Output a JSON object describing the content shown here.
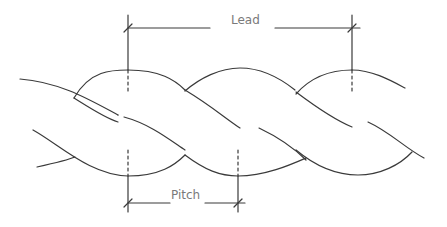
{
  "diagram": {
    "type": "twisted strand dimension drawing",
    "labels": {
      "lead": "Lead",
      "pitch": "Pitch"
    },
    "colors": {
      "line": "#3a3a3a",
      "label": "#7a7a7a",
      "background": "#ffffff"
    }
  }
}
